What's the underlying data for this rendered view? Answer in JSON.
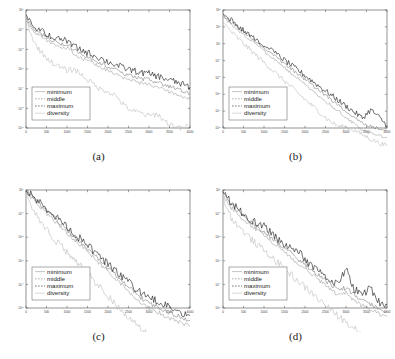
{
  "figure": {
    "panels": [
      {
        "id": "a",
        "caption": "(a)",
        "legend": [
          "minimum",
          "middle",
          "maximum",
          "diversity"
        ],
        "xticks": [
          "0",
          "500",
          "1000",
          "1500",
          "2000",
          "2500",
          "3000",
          "3500",
          "4000"
        ],
        "yticks": [
          "10^0",
          "10^-1",
          "10^-2",
          "10^-3",
          "10^-4",
          "10^-5",
          "10^-6"
        ]
      },
      {
        "id": "b",
        "caption": "(b)",
        "legend": [
          "minimum",
          "middle",
          "maximum",
          "diversity"
        ],
        "xticks": [
          "0",
          "500",
          "1000",
          "1500",
          "2000",
          "2500",
          "3000",
          "3500",
          "4000"
        ],
        "yticks": [
          "10^2",
          "10^1",
          "10^0",
          "10^-1",
          "10^-2",
          "10^-3",
          "10^-4",
          "10^-5"
        ]
      },
      {
        "id": "c",
        "caption": "(c)",
        "legend": [
          "minimum",
          "middle",
          "maximum",
          "diversity"
        ],
        "xticks": [
          "0",
          "500",
          "1000",
          "1500",
          "2000",
          "2500",
          "3000",
          "3500",
          "4000"
        ],
        "yticks": [
          "10^0",
          "10^-1",
          "10^-2",
          "10^-3",
          "10^-4",
          "10^-5"
        ]
      },
      {
        "id": "d",
        "caption": "(d)",
        "legend": [
          "minimum",
          "middle",
          "maximum",
          "diversity"
        ],
        "xticks": [
          "0",
          "500",
          "1000",
          "1500",
          "2000",
          "2500",
          "3000",
          "3500",
          "4000"
        ],
        "yticks": [
          "10^0",
          "10^-1",
          "10^-2",
          "10^-3",
          "10^-4",
          "10^-5"
        ]
      }
    ],
    "colors": {
      "minimum": "#9a9a9a",
      "middle": "#777777",
      "maximum": "#1b1b1b",
      "diversity": "#bdbdbd",
      "axis": "#4a4a4a",
      "background": "#ffffff"
    }
  },
  "chart_data": [
    {
      "type": "line",
      "title": "(a)",
      "xlabel": "",
      "ylabel": "",
      "xlim": [
        0,
        4000
      ],
      "ylim": [
        1e-06,
        1
      ],
      "yscale": "log",
      "grid": false,
      "legend_position": "lower-left",
      "x": [
        0,
        200,
        400,
        600,
        800,
        1000,
        1200,
        1400,
        1600,
        1800,
        2000,
        2200,
        2400,
        2600,
        2800,
        3000,
        3200,
        3400,
        3600,
        3800,
        4000
      ],
      "series": [
        {
          "name": "minimum",
          "values": [
            0.3,
            0.075,
            0.04,
            0.022,
            0.013,
            0.0115,
            0.0052,
            0.0032,
            0.0021,
            0.0013,
            0.0008,
            0.00052,
            0.00034,
            0.00026,
            0.00019,
            0.00016,
            0.00012,
            8.5e-05,
            6e-05,
            4.2e-05,
            3e-05
          ]
        },
        {
          "name": "middle",
          "values": [
            0.42,
            0.105,
            0.055,
            0.031,
            0.02,
            0.018,
            0.0082,
            0.005,
            0.0033,
            0.0021,
            0.0013,
            0.00086,
            0.00057,
            0.00044,
            0.00032,
            0.00028,
            0.00021,
            0.00015,
            0.00011,
            7.8e-05,
            5.5e-05
          ]
        },
        {
          "name": "maximum",
          "values": [
            0.55,
            0.145,
            0.08,
            0.047,
            0.031,
            0.028,
            0.013,
            0.0083,
            0.0056,
            0.0036,
            0.0023,
            0.0016,
            0.0011,
            0.00086,
            0.00064,
            0.00058,
            0.00044,
            0.00032,
            0.00024,
            0.00017,
            0.00012
          ]
        },
        {
          "name": "diversity",
          "values": [
            0.33,
            0.021,
            0.0062,
            0.0024,
            0.0013,
            0.00085,
            0.00095,
            0.00042,
            0.0002,
            9.5e-05,
            7.5e-05,
            4.2e-05,
            1.35e-05,
            7.2e-06,
            5.8e-06,
            4e-06,
            5.2e-06,
            2.1e-06,
            1.3e-06,
            9e-07,
            1.4e-06
          ]
        }
      ]
    },
    {
      "type": "line",
      "title": "(b)",
      "xlabel": "",
      "ylabel": "",
      "xlim": [
        0,
        4000
      ],
      "ylim": [
        1e-05,
        100
      ],
      "yscale": "log",
      "grid": false,
      "legend_position": "lower-left",
      "x": [
        0,
        200,
        400,
        600,
        800,
        1000,
        1200,
        1400,
        1600,
        1800,
        2000,
        2200,
        2400,
        2600,
        2800,
        3000,
        3200,
        3400,
        3600,
        3800,
        4000
      ],
      "series": [
        {
          "name": "minimum",
          "values": [
            42,
            14,
            5.5,
            2.2,
            0.9,
            0.36,
            0.145,
            0.058,
            0.023,
            0.0095,
            0.0038,
            0.00155,
            0.00063,
            0.00026,
            0.000105,
            4.3e-05,
            1.75e-05,
            7.2e-06,
            5e-06,
            3.6e-06,
            2.8e-06
          ]
        },
        {
          "name": "middle",
          "values": [
            52,
            19,
            8.0,
            3.3,
            1.4,
            0.58,
            0.245,
            0.102,
            0.043,
            0.018,
            0.0076,
            0.0032,
            0.00135,
            0.00057,
            0.00024,
            0.000102,
            4.3e-05,
            1.85e-05,
            1.25e-05,
            9.5e-06,
            7.5e-06
          ]
        },
        {
          "name": "maximum",
          "values": [
            62,
            24,
            10.5,
            4.5,
            2.0,
            0.85,
            0.37,
            0.16,
            0.07,
            0.03,
            0.013,
            0.0056,
            0.0024,
            0.00105,
            0.00046,
            0.0002,
            8.8e-05,
            3.9e-05,
            0.00012,
            4.5e-05,
            1.4e-05
          ]
        },
        {
          "name": "diversity",
          "values": [
            18,
            5.2,
            1.7,
            0.6,
            0.215,
            0.078,
            0.028,
            0.0102,
            0.0037,
            0.00135,
            0.0005,
            0.000185,
            6.8e-05,
            2.6e-05,
            1.3e-05,
            1.1e-05,
            7.5e-06,
            4e-06,
            2.2e-06,
            1.3e-06,
            8.5e-07
          ]
        }
      ]
    },
    {
      "type": "line",
      "title": "(c)",
      "xlabel": "",
      "ylabel": "",
      "xlim": [
        0,
        4000
      ],
      "ylim": [
        1e-05,
        1
      ],
      "yscale": "log",
      "grid": false,
      "legend_position": "lower-left",
      "x": [
        0,
        200,
        400,
        600,
        800,
        1000,
        1200,
        1400,
        1600,
        1800,
        2000,
        2200,
        2400,
        2600,
        2800,
        3000,
        3200,
        3400,
        3600,
        3800,
        4000
      ],
      "series": [
        {
          "name": "minimum",
          "values": [
            0.8,
            0.34,
            0.155,
            0.072,
            0.034,
            0.0158,
            0.0073,
            0.0034,
            0.0016,
            0.00074,
            0.00035,
            0.00016,
            7.5e-05,
            3.5e-05,
            1.6e-05,
            1e-05,
            6.8e-06,
            4.5e-06,
            3.2e-06,
            2.3e-06,
            1.7e-06
          ]
        },
        {
          "name": "middle",
          "values": [
            0.88,
            0.4,
            0.19,
            0.092,
            0.044,
            0.021,
            0.01,
            0.0048,
            0.0023,
            0.0011,
            0.00052,
            0.00025,
            0.00012,
            5.7e-05,
            2.7e-05,
            1.7e-05,
            1.15e-05,
            7.8e-06,
            5.5e-06,
            4e-06,
            3e-06
          ]
        },
        {
          "name": "maximum",
          "values": [
            0.95,
            0.46,
            0.225,
            0.112,
            0.055,
            0.027,
            0.0132,
            0.0064,
            0.0031,
            0.00152,
            0.00074,
            0.00036,
            0.000175,
            8.5e-05,
            4.2e-05,
            2.8e-05,
            1.9e-05,
            1.3e-05,
            9.2e-06,
            6.6e-06,
            4.8e-06
          ]
        },
        {
          "name": "diversity",
          "values": [
            0.72,
            0.135,
            0.038,
            0.0125,
            0.0052,
            0.0024,
            0.00105,
            0.00046,
            0.000185,
            7.8e-05,
            3.2e-05,
            1.35e-05,
            5.8e-06,
            2.6e-06,
            1.3e-06,
            7.5e-07,
            4.8e-07,
            3.2e-07,
            2.2e-07,
            1.6e-07,
            1.2e-07
          ]
        }
      ]
    },
    {
      "type": "line",
      "title": "(d)",
      "xlabel": "",
      "ylabel": "",
      "xlim": [
        0,
        4000
      ],
      "ylim": [
        1e-05,
        1
      ],
      "yscale": "log",
      "grid": false,
      "legend_position": "lower-left",
      "x": [
        0,
        200,
        400,
        600,
        800,
        1000,
        1200,
        1400,
        1600,
        1800,
        2000,
        2200,
        2400,
        2600,
        2800,
        3000,
        3200,
        3400,
        3600,
        3800,
        4000
      ],
      "series": [
        {
          "name": "minimum",
          "values": [
            0.62,
            0.175,
            0.08,
            0.04,
            0.021,
            0.0125,
            0.0062,
            0.0032,
            0.00165,
            0.00086,
            0.00045,
            0.00024,
            0.000125,
            6.8e-05,
            3.6e-05,
            4.2e-05,
            2.1e-05,
            1.25e-05,
            8.2e-06,
            5.8e-06,
            4.2e-06
          ]
        },
        {
          "name": "middle",
          "values": [
            0.74,
            0.225,
            0.107,
            0.055,
            0.029,
            0.0178,
            0.009,
            0.0047,
            0.0025,
            0.00132,
            0.0007,
            0.00038,
            0.0002,
            0.00011,
            5.9e-05,
            7e-05,
            3.5e-05,
            2.1e-05,
            1.4e-05,
            1e-05,
            7.5e-06
          ]
        },
        {
          "name": "maximum",
          "values": [
            0.86,
            0.275,
            0.135,
            0.072,
            0.039,
            0.034,
            0.0125,
            0.0066,
            0.0036,
            0.0031,
            0.00105,
            0.00058,
            0.00031,
            0.000175,
            9.6e-05,
            0.00046,
            6.2e-05,
            3.8e-05,
            7e-05,
            1.85e-05,
            1.35e-05
          ]
        },
        {
          "name": "diversity",
          "values": [
            0.45,
            0.068,
            0.026,
            0.0115,
            0.0054,
            0.0028,
            0.00135,
            0.00066,
            0.00032,
            0.000155,
            7.6e-05,
            3.8e-05,
            1.85e-05,
            9.2e-06,
            4.6e-06,
            2.6e-06,
            1.5e-06,
            9e-07,
            5.8e-07,
            3.6e-07,
            2.4e-07
          ]
        }
      ]
    }
  ]
}
